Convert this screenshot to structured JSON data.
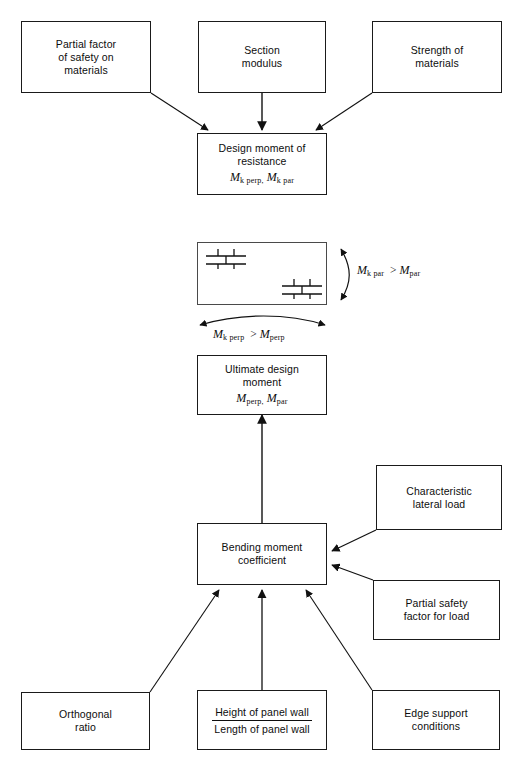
{
  "diagram": {
    "stroke_color": "#1a1a1a",
    "background": "#ffffff"
  },
  "nodes": {
    "partial_factor_materials": {
      "lines": [
        "Partial factor",
        "of safety on",
        "materials"
      ]
    },
    "section_modulus": {
      "lines": [
        "Section",
        "modulus"
      ]
    },
    "strength_materials": {
      "lines": [
        "Strength of",
        "materials"
      ]
    },
    "design_moment_resistance": {
      "lines": [
        "Design moment of",
        "resistance"
      ],
      "symbol_main_1": "M",
      "symbol_sub_1": "k perp,",
      "symbol_main_2": "M",
      "symbol_sub_2": "k par"
    },
    "ultimate_design_moment": {
      "lines": [
        "Ultimate design",
        "moment"
      ],
      "symbol_main_1": "M",
      "symbol_sub_1": "perp,",
      "symbol_main_2": "M",
      "symbol_sub_2": "par"
    },
    "bending_moment_coefficient": {
      "lines": [
        "Bending moment",
        "coefficient"
      ]
    },
    "characteristic_lateral_load": {
      "lines": [
        "Characteristic",
        "lateral load"
      ]
    },
    "partial_safety_factor_load": {
      "lines": [
        "Partial safety",
        "factor for load"
      ]
    },
    "orthogonal_ratio": {
      "lines": [
        "Orthogonal",
        "ratio"
      ]
    },
    "panel_wall_ratio": {
      "numerator": "Height of panel wall",
      "denominator": "Length of panel wall"
    },
    "edge_support_conditions": {
      "lines": [
        "Edge support",
        "conditions"
      ]
    }
  },
  "wall_panel": {
    "label": "masonry panel wall with brick bond symbols"
  },
  "annotations": {
    "vertical_inequality": {
      "lhs_main": "M",
      "lhs_sub": "k par",
      "operator": ">",
      "rhs_main": "M",
      "rhs_sub": "par"
    },
    "horizontal_inequality": {
      "lhs_main": "M",
      "lhs_sub": "k perp",
      "operator": ">",
      "rhs_main": "M",
      "rhs_sub": "perp"
    }
  }
}
